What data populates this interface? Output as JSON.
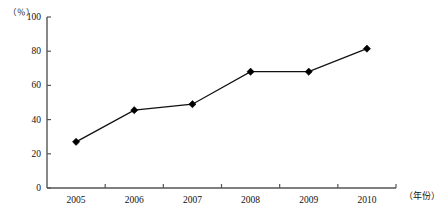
{
  "chart_data": {
    "type": "line",
    "title": "",
    "xlabel": "（年份）",
    "ylabel": "（％）",
    "categories": [
      "2005",
      "2006",
      "2007",
      "2008",
      "2009",
      "2010"
    ],
    "values": [
      27,
      45.5,
      49,
      68,
      68,
      81.5
    ],
    "series": [
      {
        "name": "",
        "values": [
          27,
          45.5,
          49,
          68,
          68,
          81.5
        ]
      }
    ],
    "ylim": [
      0,
      100
    ],
    "yticks": [
      0,
      20,
      40,
      60,
      80,
      100
    ],
    "ytick_labels": [
      "0",
      "20",
      "40",
      "60",
      "80",
      "100"
    ],
    "grid": false,
    "legend": "none",
    "marker": "diamond",
    "line_color": "#111111",
    "marker_color": "#000000",
    "axis_color": "#555555",
    "background": "#ffffff"
  },
  "axes": {
    "y_unit_label": "（％）",
    "x_unit_label": "（年份）",
    "y_ticks": [
      {
        "label": "100",
        "value": 100
      },
      {
        "label": "80",
        "value": 80
      },
      {
        "label": "60",
        "value": 60
      },
      {
        "label": "40",
        "value": 40
      },
      {
        "label": "20",
        "value": 20
      },
      {
        "label": "0",
        "value": 0
      }
    ],
    "x_ticks": [
      {
        "label": "2005"
      },
      {
        "label": "2006"
      },
      {
        "label": "2007"
      },
      {
        "label": "2008"
      },
      {
        "label": "2009"
      },
      {
        "label": "2010"
      }
    ]
  }
}
